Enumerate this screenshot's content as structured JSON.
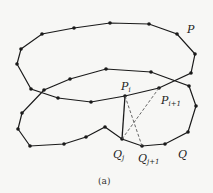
{
  "figure": {
    "caption": "(a)",
    "polygon_P": {
      "label": "P",
      "label_pos": [
        187,
        33
      ],
      "points": [
        [
          21,
          49
        ],
        [
          42,
          34
        ],
        [
          74,
          28
        ],
        [
          110,
          23
        ],
        [
          149,
          24
        ],
        [
          177,
          34
        ],
        [
          195,
          54
        ],
        [
          191,
          73
        ],
        [
          159,
          88
        ],
        [
          125,
          96
        ],
        [
          91,
          102
        ],
        [
          58,
          98
        ],
        [
          31,
          89
        ],
        [
          17,
          64
        ]
      ],
      "closed": true
    },
    "polygon_Q": {
      "label": "Q",
      "label_pos": [
        178,
        158
      ],
      "points": [
        [
          44,
          90
        ],
        [
          22,
          113
        ],
        [
          18,
          129
        ],
        [
          30,
          146
        ],
        [
          64,
          144
        ],
        [
          86,
          137
        ],
        [
          105,
          127
        ],
        [
          122,
          139
        ],
        [
          142,
          146
        ],
        [
          165,
          144
        ],
        [
          188,
          132
        ],
        [
          196,
          106
        ],
        [
          189,
          86
        ],
        [
          151,
          72
        ],
        [
          106,
          69
        ],
        [
          70,
          79
        ]
      ],
      "closed": true
    },
    "special_points": {
      "P_i": {
        "label": "P",
        "sub": "i",
        "pos": [
          125,
          96
        ],
        "label_pos": [
          121,
          90
        ]
      },
      "P_i1": {
        "label": "P",
        "sub": "i+1",
        "pos": [
          159,
          88
        ],
        "label_pos": [
          161,
          104
        ]
      },
      "Q_j": {
        "label": "Q",
        "sub": "j",
        "pos": [
          122,
          139
        ],
        "label_pos": [
          113,
          158
        ]
      },
      "Q_j1": {
        "label": "Q",
        "sub": "j+1",
        "pos": [
          142,
          146
        ],
        "label_pos": [
          138,
          162
        ]
      }
    },
    "solid_edge": [
      [
        125,
        96
      ],
      [
        122,
        139
      ]
    ],
    "dashed_edges": [
      [
        [
          125,
          96
        ],
        [
          142,
          146
        ]
      ],
      [
        [
          159,
          88
        ],
        [
          122,
          139
        ]
      ]
    ],
    "colors": {
      "line": "#1a1a1a",
      "dash": "#555555",
      "background": "#f7f7f5"
    }
  }
}
